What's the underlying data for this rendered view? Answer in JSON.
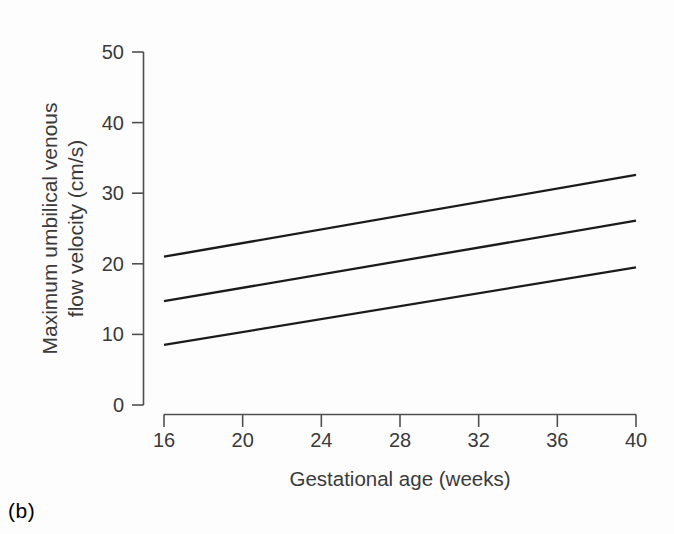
{
  "figure_label": "(b)",
  "colors": {
    "background": "#fdfdfd",
    "axis": "#4f4f4f",
    "text": "#3a3a3a",
    "line": "#1b1b1b"
  },
  "chart_data": {
    "type": "line",
    "title": "",
    "xlabel": "Gestational age (weeks)",
    "ylabel": "Maximum umbilical venous flow velocity (cm/s)",
    "ylabel_lines": [
      "Maximum umbilical venous",
      "flow velocity (cm/s)"
    ],
    "xlim": [
      16,
      40
    ],
    "ylim": [
      0,
      50
    ],
    "xticks": [
      16,
      20,
      24,
      28,
      32,
      36,
      40
    ],
    "yticks": [
      0,
      10,
      20,
      30,
      40,
      50
    ],
    "grid": false,
    "legend": "none",
    "series": [
      {
        "name": "upper-reference-limit",
        "x": [
          16,
          40
        ],
        "values": [
          21.0,
          32.6
        ]
      },
      {
        "name": "median",
        "x": [
          16,
          40
        ],
        "values": [
          14.7,
          26.1
        ]
      },
      {
        "name": "lower-reference-limit",
        "x": [
          16,
          40
        ],
        "values": [
          8.5,
          19.5
        ]
      }
    ]
  }
}
